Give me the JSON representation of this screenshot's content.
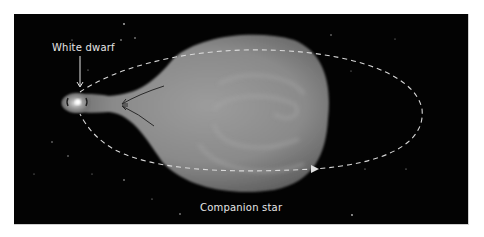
{
  "figure": {
    "labels": {
      "white_dwarf": "White dwarf",
      "companion_star": "Companion star"
    },
    "colors": {
      "background": "#030303",
      "page": "#ffffff",
      "star_fill": "#8a8a8a",
      "orbit": "#d8d8d8",
      "label_text": "#e6e6e6"
    },
    "elements": {
      "orbit_path": "dashed elliptical orbit with arrowheads",
      "mass_stream_arrows": 2
    }
  }
}
